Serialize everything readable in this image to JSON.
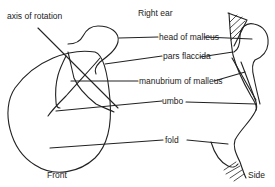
{
  "title": "Right ear",
  "labels": {
    "axis": "axis of rotation",
    "head": "head of malleus",
    "pars": "pars flaccida",
    "manubrium": "manubrium of malleus",
    "umbo": "umbo",
    "fold": "fold"
  },
  "views": {
    "front": "Front",
    "side": "Side"
  },
  "colors": {
    "line": "#222222",
    "background": "#ffffff"
  }
}
